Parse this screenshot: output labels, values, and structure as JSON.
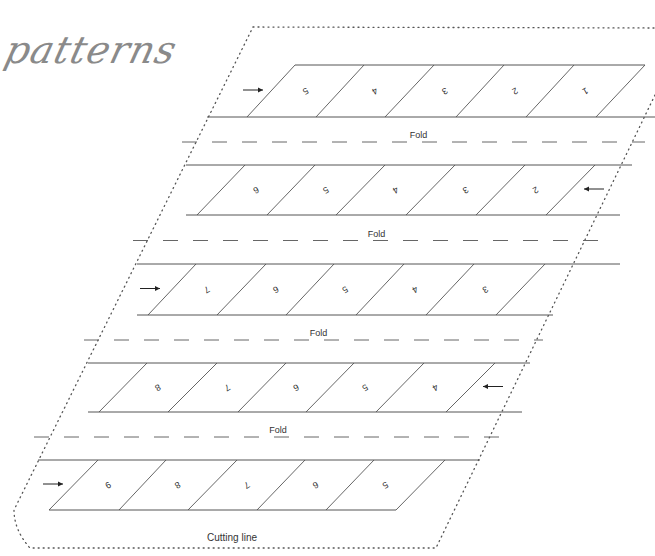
{
  "title": "patterns",
  "labels": {
    "fold": "Fold",
    "cutting_line": "Cutting line"
  },
  "colors": {
    "line": "#555555",
    "dash": "#666666",
    "dots": "#555555",
    "title": "#8a8a8a",
    "text": "#333333"
  },
  "rows": [
    {
      "name": "row-1",
      "arrow": "right",
      "numbers": [
        "5",
        "4",
        "3",
        "2",
        "1"
      ],
      "fold_after": true
    },
    {
      "name": "row-2",
      "arrow": "left",
      "numbers": [
        "6",
        "5",
        "4",
        "3",
        "2"
      ],
      "fold_after": true
    },
    {
      "name": "row-3",
      "arrow": "right",
      "numbers": [
        "7",
        "6",
        "5",
        "4",
        "3"
      ],
      "fold_after": true
    },
    {
      "name": "row-4",
      "arrow": "left",
      "numbers": [
        "8",
        "7",
        "6",
        "5",
        "4"
      ],
      "fold_after": true
    },
    {
      "name": "row-5",
      "arrow": "right",
      "numbers": [
        "9",
        "8",
        "7",
        "6",
        "5"
      ],
      "fold_after": false
    }
  ]
}
